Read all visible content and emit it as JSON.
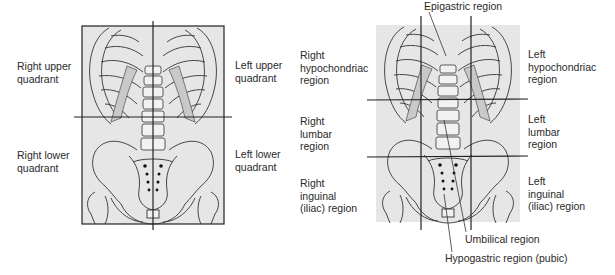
{
  "quadrants_diagram": {
    "labels": {
      "right_upper": "Right upper\nquadrant",
      "left_upper": "Left upper\nquadrant",
      "right_lower": "Right lower\nquadrant",
      "left_lower": "Left lower\nquadrant"
    }
  },
  "regions_diagram": {
    "labels": {
      "epigastric": "Epigastric region",
      "right_hypochondriac": "Right\nhypochondriac\nregion",
      "left_hypochondriac": "Left\nhypochondriac\nregion",
      "right_lumbar": "Right\nlumbar\nregion",
      "left_lumbar": "Left\nlumbar\nregion",
      "right_inguinal": "Right\ninguinal\n(iliac) region",
      "left_inguinal": "Left\ninguinal\n(iliac) region",
      "umbilical": "Umbilical region",
      "hypogastric": "Hypogastric region (pubic)"
    }
  },
  "colors": {
    "panel_bg": "#e6e6e6",
    "line": "#222222",
    "shade": "#c9c9c9"
  }
}
